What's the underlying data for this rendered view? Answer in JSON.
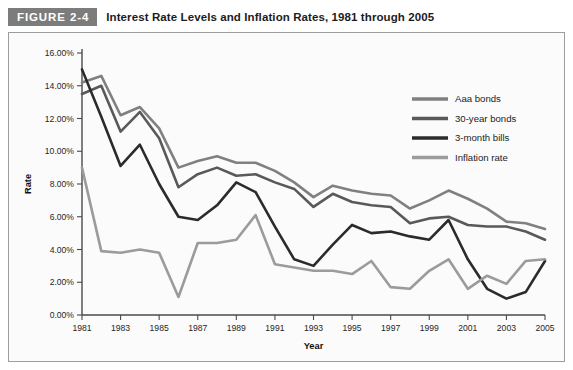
{
  "figure": {
    "tag": "FIGURE 2-4",
    "caption": "Interest Rate Levels and Inflation Rates, 1981 through 2005"
  },
  "chart_data": {
    "type": "line",
    "title": "Interest Rate Levels and Inflation Rates, 1981 through 2005",
    "xlabel": "Year",
    "ylabel": "Rate",
    "xlim": [
      1981,
      2005
    ],
    "ylim": [
      0,
      16
    ],
    "ytick_step": 2,
    "ytick_format": "percent-2dp",
    "xtick_step": 2,
    "grid": false,
    "legend_position": "top-right",
    "yticks": [
      "0.00%",
      "2.00%",
      "4.00%",
      "6.00%",
      "8.00%",
      "10.00%",
      "12.00%",
      "14.00%",
      "16.00%"
    ],
    "ytick_values": [
      0,
      2,
      4,
      6,
      8,
      10,
      12,
      14,
      16
    ],
    "x": [
      1981,
      1982,
      1983,
      1984,
      1985,
      1986,
      1987,
      1988,
      1989,
      1990,
      1991,
      1992,
      1993,
      1994,
      1995,
      1996,
      1997,
      1998,
      1999,
      2000,
      2001,
      2002,
      2003,
      2004,
      2005
    ],
    "xticks": [
      "1981",
      "1983",
      "1985",
      "1987",
      "1989",
      "1991",
      "1993",
      "1995",
      "1997",
      "1999",
      "2001",
      "2003",
      "2005"
    ],
    "xtick_values": [
      1981,
      1983,
      1985,
      1987,
      1989,
      1991,
      1993,
      1995,
      1997,
      1999,
      2001,
      2003,
      2005
    ],
    "series": [
      {
        "name": "Aaa bonds",
        "color": "#808080",
        "width": 2.6,
        "values": [
          14.2,
          14.6,
          12.2,
          12.7,
          11.4,
          9.0,
          9.4,
          9.7,
          9.3,
          9.3,
          8.8,
          8.1,
          7.2,
          7.9,
          7.6,
          7.4,
          7.3,
          6.5,
          7.0,
          7.6,
          7.1,
          6.5,
          5.7,
          5.6,
          5.25
        ]
      },
      {
        "name": "30-year bonds",
        "color": "#595959",
        "width": 2.6,
        "values": [
          13.5,
          14.0,
          11.2,
          12.4,
          10.8,
          7.8,
          8.6,
          9.0,
          8.5,
          8.6,
          8.1,
          7.7,
          6.6,
          7.4,
          6.9,
          6.7,
          6.6,
          5.6,
          5.9,
          6.0,
          5.5,
          5.4,
          5.4,
          5.1,
          4.6
        ]
      },
      {
        "name": "3-month bills",
        "color": "#2b2b2b",
        "width": 2.6,
        "values": [
          15.0,
          12.1,
          9.1,
          10.4,
          8.0,
          6.0,
          5.8,
          6.7,
          8.1,
          7.5,
          5.4,
          3.4,
          3.0,
          4.3,
          5.5,
          5.0,
          5.1,
          4.8,
          4.6,
          5.8,
          3.4,
          1.6,
          1.0,
          1.4,
          3.3
        ]
      },
      {
        "name": "Inflation rate",
        "color": "#9b9b9b",
        "width": 2.6,
        "values": [
          9.0,
          3.9,
          3.8,
          4.0,
          3.8,
          1.1,
          4.4,
          4.4,
          4.6,
          6.1,
          3.1,
          2.9,
          2.7,
          2.7,
          2.5,
          3.3,
          1.7,
          1.6,
          2.7,
          3.4,
          1.6,
          2.4,
          1.9,
          3.3,
          3.4
        ]
      }
    ]
  }
}
